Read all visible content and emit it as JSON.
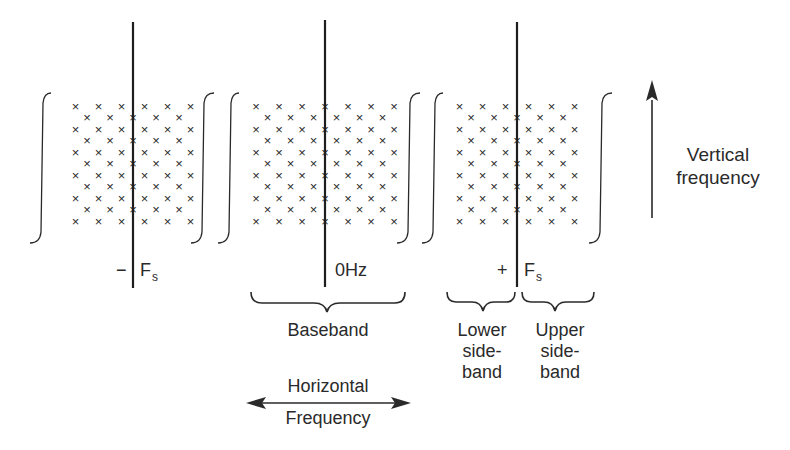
{
  "diagram": {
    "type": "2D frequency spectrum of sampled video signal",
    "spectra": [
      {
        "id": "minus-fs",
        "sign": "−",
        "label": "F",
        "subscript": "s"
      },
      {
        "id": "baseband",
        "sign": "",
        "label": "0Hz",
        "subscript": ""
      },
      {
        "id": "plus-fs",
        "sign": "+",
        "label": "F",
        "subscript": "s"
      }
    ],
    "sample_marker": "×",
    "brackets": {
      "baseband": "Baseband",
      "lower_sideband": [
        "Lower",
        "side-",
        "band"
      ],
      "upper_sideband": [
        "Upper",
        "side-",
        "band"
      ]
    },
    "axes": {
      "horizontal": [
        "Horizontal",
        "Frequency"
      ],
      "vertical": [
        "Vertical",
        "frequency"
      ]
    }
  }
}
